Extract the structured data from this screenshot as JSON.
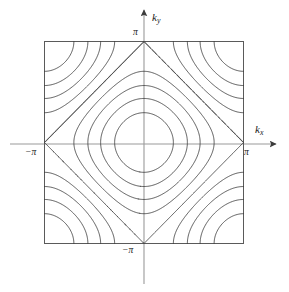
{
  "figure": {
    "title": "",
    "background_color": "#ffffff",
    "line_color": "#3c3c3c",
    "text_color": "#1a1a1a"
  },
  "axes": {
    "x_axis_label": "k",
    "x_axis_sub": "x",
    "y_axis_label": "k",
    "y_axis_sub": "y",
    "x_tick_min_label": "−π",
    "x_tick_max_label": "π",
    "y_tick_min_label": "−π",
    "y_tick_max_label": "π"
  },
  "chart_data": {
    "type": "line",
    "subtype": "contour",
    "title": "",
    "xlabel": "k_x",
    "ylabel": "k_y",
    "xlim": [
      -3.141592653589793,
      3.141592653589793
    ],
    "ylim": [
      -3.141592653589793,
      3.141592653589793
    ],
    "xticks": [
      -3.141592653589793,
      3.141592653589793
    ],
    "xticklabels": [
      "−π",
      "π"
    ],
    "yticks": [
      -3.141592653589793,
      3.141592653589793
    ],
    "yticklabels": [
      "−π",
      "π"
    ],
    "grid": false,
    "legend": "none",
    "function": "E(kx,ky) = -(cos(kx) + cos(ky))",
    "contour_levels": [
      -1.6,
      -1.2,
      -0.8,
      -0.4,
      0.0,
      0.4,
      0.8,
      1.2,
      1.6
    ],
    "level_count": 9,
    "zero_level": 0.0,
    "zmin": -2.0,
    "zmax": 2.0,
    "grid_resolution": 241,
    "border": "square box spanning the full Brillouin zone",
    "axis_arrows": true
  }
}
